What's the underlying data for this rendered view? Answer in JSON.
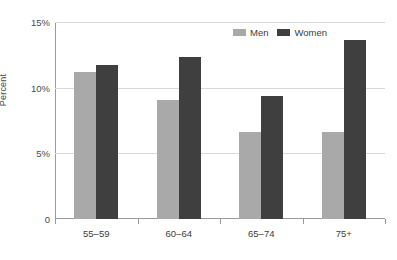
{
  "chart_data": {
    "type": "bar",
    "title": "",
    "xlabel": "",
    "ylabel": "Percent",
    "categories": [
      "55–59",
      "60–64",
      "65–74",
      "75+"
    ],
    "series": [
      {
        "name": "Men",
        "color": "#a9a9a9",
        "values": [
          11.2,
          9.1,
          6.6,
          6.6
        ]
      },
      {
        "name": "Women",
        "color": "#3f3f3f",
        "values": [
          11.7,
          12.3,
          9.4,
          13.6
        ]
      }
    ],
    "ylim": [
      0,
      15
    ],
    "yticks": [
      0,
      5,
      10,
      15
    ],
    "ytick_labels": [
      "0",
      "5%",
      "10%",
      "15%"
    ],
    "grid": true,
    "legend_position": "top-right"
  },
  "legend": {
    "items": [
      {
        "label": "Men"
      },
      {
        "label": "Women"
      }
    ]
  }
}
